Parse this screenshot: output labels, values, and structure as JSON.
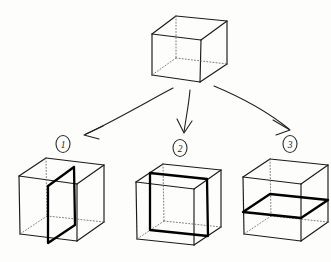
{
  "figure": {
    "background_color": "#fdfdfc",
    "ink_color": "#1a1a1a",
    "hidden_edge_color": "#6e6e6e",
    "plane_color": "#000000",
    "style": "hand-drawn pencil sketch, wireframe cubes with dotted hidden edges"
  },
  "source_cube": {
    "label": "",
    "description": "wireframe cube shown at top of figure, hidden edges dotted",
    "position": {
      "x": 189,
      "y": 48
    }
  },
  "arrows": [
    {
      "name": "arrow-to-cube-1",
      "from": {
        "x": 173,
        "y": 88
      },
      "to": {
        "x": 84,
        "y": 135
      },
      "direction": "down-left"
    },
    {
      "name": "arrow-to-cube-2",
      "from": {
        "x": 190,
        "y": 90
      },
      "to": {
        "x": 184,
        "y": 133
      },
      "direction": "down"
    },
    {
      "name": "arrow-to-cube-3",
      "from": {
        "x": 214,
        "y": 86
      },
      "to": {
        "x": 288,
        "y": 130
      },
      "direction": "down-right"
    }
  ],
  "result_cubes": [
    {
      "id": 1,
      "label": "1",
      "label_style": "circled",
      "plane_orientation": "vertical sagittal plane",
      "plane_description": "bold vertical plane parallel to the left and right faces, cutting front-to-back through the cube",
      "center": {
        "x": 62,
        "y": 200
      }
    },
    {
      "id": 2,
      "label": "2",
      "label_style": "circled",
      "plane_orientation": "vertical frontal plane",
      "plane_description": "bold square plane parallel to the front and back faces, cutting left-to-right through the cube",
      "center": {
        "x": 178,
        "y": 202
      }
    },
    {
      "id": 3,
      "label": "3",
      "label_style": "circled",
      "plane_orientation": "horizontal transverse plane",
      "plane_description": "bold horizontal plane parallel to the top and bottom faces, cutting through the middle of the cube",
      "center": {
        "x": 288,
        "y": 200
      }
    }
  ]
}
